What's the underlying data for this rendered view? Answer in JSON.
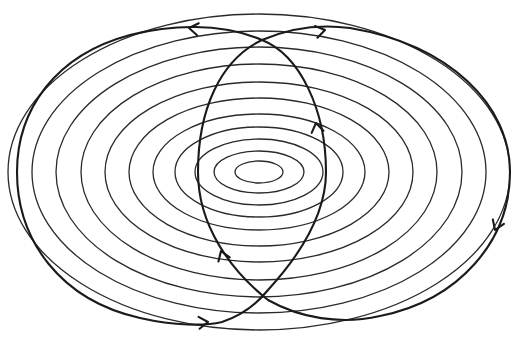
{
  "diagram": {
    "title": "",
    "type": "phase-portrait-contours",
    "width": 514,
    "height": 345,
    "colors": {
      "background": "#ffffff",
      "contour_stroke": "#2a2a2a",
      "trajectory_stroke": "#1a1a1a"
    },
    "center": {
      "x": 259,
      "y": 172
    },
    "contours": [
      {
        "rx": 24,
        "ry": 11
      },
      {
        "rx": 45,
        "ry": 21
      },
      {
        "rx": 64,
        "ry": 33
      },
      {
        "rx": 84,
        "ry": 45
      },
      {
        "rx": 106,
        "ry": 58
      },
      {
        "rx": 130,
        "ry": 74
      },
      {
        "rx": 154,
        "ry": 90
      },
      {
        "rx": 178,
        "ry": 108
      },
      {
        "rx": 203,
        "ry": 125
      },
      {
        "rx": 227,
        "ry": 141
      },
      {
        "rx": 251,
        "ry": 158
      }
    ],
    "trajectories": [
      {
        "name": "left-loop",
        "path": "M 326 172 C 326 110 300 55 262 40 C 220 22 170 25 130 35 C 55 55 17 110 17 172 C 17 240 60 300 140 318 C 175 326 205 326 222 322 C 240 316 256 305 268 290 C 300 255 326 215 326 172 Z"
      },
      {
        "name": "right-loop",
        "path": "M 198 172 C 198 110 220 60 262 40 C 290 28 320 24 350 28 C 450 45 510 105 510 172 C 510 240 460 300 380 316 C 340 325 300 318 268 300 C 230 270 198 225 198 172 Z"
      }
    ],
    "arrows": [
      {
        "name": "arrow-top-left",
        "x": 189,
        "y": 28,
        "angle": 188
      },
      {
        "name": "arrow-top-right",
        "x": 325,
        "y": 30,
        "angle": -12
      },
      {
        "name": "arrow-right",
        "x": 495,
        "y": 230,
        "angle": 112
      },
      {
        "name": "arrow-bottom-left",
        "x": 208,
        "y": 322,
        "angle": -5
      },
      {
        "name": "arrow-inner-left",
        "x": 221,
        "y": 251,
        "angle": -110
      },
      {
        "name": "arrow-inner-right",
        "x": 316,
        "y": 123,
        "angle": -100
      }
    ]
  }
}
